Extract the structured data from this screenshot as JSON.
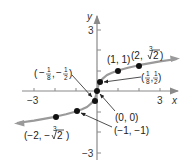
{
  "figure": {
    "function": "f(x) = cube root of x",
    "axes": {
      "x_label": "x",
      "y_label": "y",
      "x_ticks": {
        "min_label": "−3",
        "max_label": "3"
      },
      "y_ticks": {
        "max_label": "3",
        "min_label": "−3"
      }
    },
    "colors": {
      "curve": "#9a9a9a",
      "axis": "#8a8a8a",
      "points": "#111111",
      "text": "#222222"
    },
    "points": [
      {
        "name": "neg-two",
        "label": "(−2, −∛2)",
        "x": -2,
        "y": -1.26
      },
      {
        "name": "neg-one",
        "label": "(−1, −1)",
        "x": -1,
        "y": -1
      },
      {
        "name": "neg-eighth",
        "label": "(−1/8, −1/2)",
        "x": -0.125,
        "y": -0.5
      },
      {
        "name": "origin",
        "label": "(0, 0)",
        "x": 0,
        "y": 0
      },
      {
        "name": "pos-eighth",
        "label": "(1/8, 1/2)",
        "x": 0.125,
        "y": 0.5
      },
      {
        "name": "one",
        "label": "(1, 1)",
        "x": 1,
        "y": 1
      },
      {
        "name": "two",
        "label": "(2, ∛2)",
        "x": 2,
        "y": 1.26
      }
    ],
    "labels": {
      "one_one": "(1, 1)",
      "origin": "(0, 0)",
      "neg_one": "(−1, −1)",
      "two_open": "(2, ",
      "two_root_index": "3",
      "two_radicand": "2",
      "two_close": ")",
      "neg_two_open": "(−2, −",
      "neg_two_root_index": "3",
      "neg_two_radicand": "2",
      "neg_two_close": ")",
      "pos_eighth_num1": "1",
      "pos_eighth_den1": "8",
      "pos_eighth_num2": "1",
      "pos_eighth_den2": "2",
      "neg_eighth_sign1": "−",
      "neg_eighth_num1": "1",
      "neg_eighth_den1": "8",
      "neg_eighth_sign2": "−",
      "neg_eighth_num2": "1",
      "neg_eighth_den2": "2",
      "comma": ","
    }
  }
}
